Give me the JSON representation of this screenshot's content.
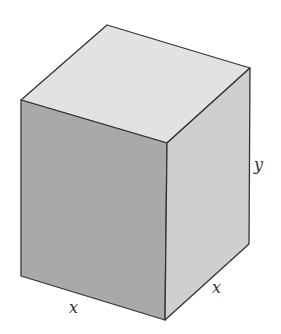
{
  "figure": {
    "type": "rectangular prism (square base)",
    "labels": {
      "front_width": "x",
      "depth": "x",
      "height": "y"
    },
    "colors": {
      "top_face": "#e2e2e2",
      "front_face": "#a9a9a9",
      "side_face": "#cfcfcf",
      "edge": "#333333"
    }
  }
}
